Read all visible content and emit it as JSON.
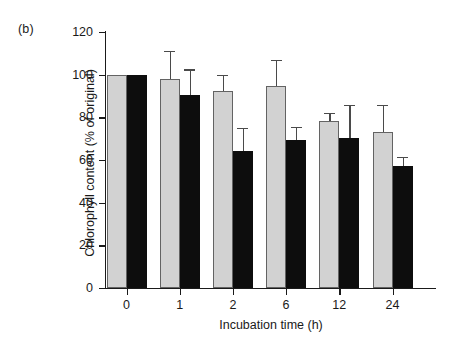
{
  "figure": {
    "panel_label": "(b)"
  },
  "chart_data": {
    "type": "bar",
    "title": "",
    "subtitle": "",
    "xlabel": "Incubation time (h)",
    "ylabel": "Chlorophyll content (% of original)",
    "categories": [
      "0",
      "1",
      "2",
      "6",
      "12",
      "24"
    ],
    "ylim": [
      0,
      120
    ],
    "yticks": [
      0,
      20,
      40,
      60,
      80,
      100,
      120
    ],
    "ytick_labels": [
      "0",
      "20",
      "40",
      "60",
      "80",
      "100",
      "120"
    ],
    "grid": false,
    "legend": "none",
    "error_bar_type": "upper-only",
    "series": [
      {
        "name": "light-grey-bars",
        "color": "#d2d2d2",
        "edge_color": "#636363",
        "values": [
          100,
          98,
          92.5,
          94.5,
          78.5,
          73
        ],
        "errors": [
          0,
          13,
          7.5,
          12.5,
          3.5,
          13
        ]
      },
      {
        "name": "black-bars",
        "color": "#0d0d0d",
        "edge_color": "#0d0d0d",
        "values": [
          100,
          90.5,
          64,
          69.5,
          70.5,
          57
        ],
        "errors": [
          0,
          12,
          11,
          6,
          15.5,
          4.5
        ]
      }
    ]
  }
}
